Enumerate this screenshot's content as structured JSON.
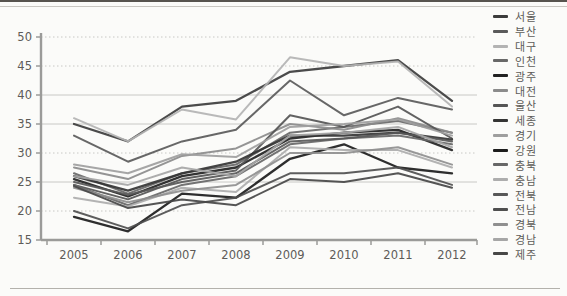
{
  "chart_data": {
    "type": "line",
    "title": "",
    "xlabel": "",
    "ylabel": "",
    "x": [
      "2005",
      "2006",
      "2007",
      "2008",
      "2009",
      "2010",
      "2011",
      "2012"
    ],
    "ylim": [
      15,
      50
    ],
    "yticks": [
      {
        "value": 50,
        "label": "50",
        "style": "dotted"
      },
      {
        "value": 45,
        "label": "45",
        "style": "dotted"
      },
      {
        "value": 40,
        "label": "40",
        "style": "solid"
      },
      {
        "value": 35,
        "label": "35",
        "style": "solid"
      },
      {
        "value": 30,
        "label": "30",
        "style": "dotted"
      },
      {
        "value": 25,
        "label": "25",
        "style": "solid"
      },
      {
        "value": 20,
        "label": "20",
        "style": "dotted"
      },
      {
        "value": 15,
        "label": "15",
        "style": "axis"
      }
    ],
    "grid": true,
    "legend_position": "right",
    "axis_color": "#9b9b99",
    "grid_color": "#c8c8c5",
    "label_color": "#5d5b58",
    "series": [
      {
        "name": "서울",
        "color": "#3c3c3c",
        "width": 2.3,
        "values": [
          35,
          32,
          38,
          39,
          44,
          45,
          46,
          39
        ]
      },
      {
        "name": "부산",
        "color": "#5a5a5a",
        "width": 2,
        "values": [
          33,
          28.5,
          32,
          34,
          42.5,
          36.5,
          39.5,
          37.5
        ]
      },
      {
        "name": "대구",
        "color": "#b3b3b3",
        "width": 2,
        "values": [
          36,
          32,
          37.5,
          35.8,
          46.5,
          45,
          45.8,
          38
        ]
      },
      {
        "name": "인천",
        "color": "#686868",
        "width": 2,
        "values": [
          26.5,
          23,
          26.5,
          28,
          33.5,
          34.5,
          35.5,
          33.5
        ]
      },
      {
        "name": "광주",
        "color": "#222222",
        "width": 2.3,
        "values": [
          25.5,
          22.5,
          26,
          27.5,
          32.5,
          33.5,
          34,
          30.5
        ]
      },
      {
        "name": "대전",
        "color": "#8b8b8b",
        "width": 2,
        "values": [
          27.5,
          25.5,
          29.5,
          30.8,
          35,
          34,
          36,
          33.5
        ]
      },
      {
        "name": "울산",
        "color": "#555555",
        "width": 2,
        "values": [
          24.5,
          22,
          25.5,
          27,
          36.5,
          34.5,
          38,
          32.5
        ]
      },
      {
        "name": "세종",
        "color": "#343434",
        "width": 2.3,
        "values": [
          26,
          23.5,
          26.5,
          28.5,
          33,
          33,
          33.5,
          32.3
        ]
      },
      {
        "name": "경기",
        "color": "#9e9e9e",
        "width": 2,
        "values": [
          28,
          26.5,
          29.8,
          29.3,
          34.5,
          35,
          35.8,
          33
        ]
      },
      {
        "name": "강원",
        "color": "#1c1c1c",
        "width": 2.3,
        "values": [
          19,
          16.5,
          23,
          22.3,
          29,
          31.5,
          27.5,
          26.5
        ]
      },
      {
        "name": "충북",
        "color": "#676767",
        "width": 2,
        "values": [
          24.5,
          21,
          24.5,
          26,
          31.5,
          32.5,
          33,
          31.5
        ]
      },
      {
        "name": "충남",
        "color": "#adadad",
        "width": 2,
        "values": [
          22.3,
          20.8,
          24,
          23.3,
          31,
          30.5,
          30.5,
          27.5
        ]
      },
      {
        "name": "전북",
        "color": "#585858",
        "width": 2,
        "values": [
          25,
          22.8,
          25,
          26.5,
          32,
          32.5,
          33.5,
          32
        ]
      },
      {
        "name": "전남",
        "color": "#4f4f4f",
        "width": 2,
        "values": [
          20,
          17,
          21,
          22.3,
          26.5,
          26.5,
          27.5,
          24.5
        ]
      },
      {
        "name": "경북",
        "color": "#8f8f8f",
        "width": 2,
        "values": [
          24,
          21.5,
          23.5,
          24.5,
          30,
          30,
          31,
          28
        ]
      },
      {
        "name": "경남",
        "color": "#a6a6a6",
        "width": 2,
        "values": [
          26,
          24.5,
          27.5,
          26,
          33,
          33.5,
          34.5,
          31
        ]
      },
      {
        "name": "제주",
        "color": "#474747",
        "width": 2,
        "values": [
          24.3,
          20.5,
          22,
          21,
          25.5,
          25,
          26.5,
          24
        ]
      }
    ]
  }
}
